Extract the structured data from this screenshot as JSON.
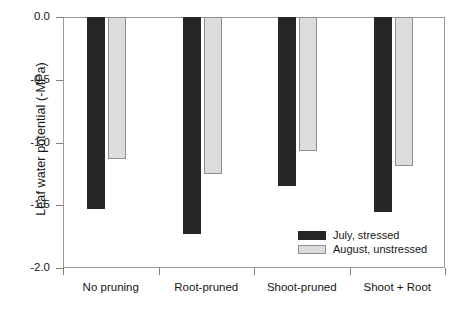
{
  "chart_data": {
    "type": "bar",
    "title": "",
    "xlabel": "",
    "ylabel": "Leaf water potential (-MPa)",
    "categories": [
      "No pruning",
      "Root-pruned",
      "Shoot-pruned",
      "Shoot + Root"
    ],
    "series": [
      {
        "name": "July, stressed",
        "color": "#262626",
        "values": [
          -1.53,
          -1.73,
          -1.35,
          -1.55
        ]
      },
      {
        "name": "August, unstressed",
        "color": "#dcdcdc",
        "values": [
          -1.13,
          -1.25,
          -1.07,
          -1.19
        ]
      }
    ],
    "ylim": [
      -2.0,
      0.0
    ],
    "y_ticks": [
      "0.0",
      "-0.5",
      "-1.0",
      "-1.5",
      "-2.0"
    ],
    "y_tick_values": [
      0.0,
      -0.5,
      -1.0,
      -1.5,
      -2.0
    ],
    "grid": false,
    "legend_position": "inside-bottom-right",
    "bar_direction": "downward-from-zero"
  },
  "axis": {
    "y_title": "Leaf water potential (-MPa)"
  },
  "legend": {
    "entries": [
      {
        "label": "July, stressed"
      },
      {
        "label": "August, unstressed"
      }
    ]
  }
}
